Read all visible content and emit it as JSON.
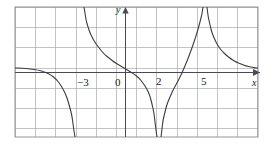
{
  "figure": {
    "kind": "cartesian-graph",
    "width": 275,
    "height": 145,
    "background": "#ffffff",
    "grid": {
      "color": "#a9a9ad",
      "border_color": "#8a8a90",
      "cell_px": 20.2,
      "left_px": 15,
      "top_px": 7,
      "right_px": 258,
      "bottom_px": 137,
      "visible": true
    },
    "axes": {
      "x_axis_y_px": 72,
      "y_axis_x_px": 125,
      "color": "#4a4a50",
      "x_label": "x",
      "y_label": "y",
      "x_arrow": "right",
      "y_arrow": "up"
    },
    "tick_labels": [
      {
        "text": "−3",
        "x_px": 77,
        "y_px": 77,
        "value": -3
      },
      {
        "text": "0",
        "x_px": 115,
        "y_px": 77,
        "value": 0
      },
      {
        "text": "2",
        "x_px": 156,
        "y_px": 76,
        "value": 2
      },
      {
        "text": "5",
        "x_px": 201,
        "y_px": 76,
        "value": 5
      }
    ]
  },
  "chart_data": {
    "type": "line",
    "title": "",
    "xlabel": "x",
    "ylabel": "y",
    "grid": true,
    "legend": null,
    "xlim": [
      -5.5,
      6.6
    ],
    "ylim": [
      -3.2,
      3.2
    ],
    "x_ticks": [
      -3,
      0,
      2,
      5
    ],
    "y_ticks": [],
    "vertical_asymptotes": [
      -2.3,
      1.55,
      3.9
    ],
    "horizontal_asymptote": 0,
    "series": [
      {
        "name": "branch-far-left",
        "comment": "upper-left branch, comes from left near y=0 then falls to -infinity at leftmost asymptote",
        "points_px": [
          [
            15,
            68
          ],
          [
            22,
            68
          ],
          [
            30,
            69
          ],
          [
            38,
            70
          ],
          [
            45,
            72
          ],
          [
            51,
            75
          ],
          [
            56,
            79
          ],
          [
            60,
            84
          ],
          [
            63,
            89
          ],
          [
            66,
            95
          ],
          [
            68,
            101
          ],
          [
            70,
            108
          ],
          [
            72,
            116
          ],
          [
            73,
            124
          ],
          [
            74,
            131
          ],
          [
            75,
            137
          ]
        ]
      },
      {
        "name": "branch-left-right-side",
        "comment": "descends from +infinity at leftmost asymptote, crosses x-axis near x=0, falls to -infinity at middle asymptote",
        "points_px": [
          [
            84,
            7
          ],
          [
            85,
            13
          ],
          [
            86,
            20
          ],
          [
            88,
            27
          ],
          [
            90,
            33
          ],
          [
            93,
            39
          ],
          [
            96,
            44
          ],
          [
            100,
            49
          ],
          [
            104,
            54
          ],
          [
            109,
            58
          ],
          [
            114,
            62
          ],
          [
            119,
            65
          ],
          [
            124,
            68
          ],
          [
            129,
            71
          ],
          [
            134,
            74
          ],
          [
            139,
            78
          ],
          [
            143,
            83
          ],
          [
            147,
            89
          ],
          [
            150,
            96
          ],
          [
            152,
            104
          ],
          [
            154,
            113
          ],
          [
            155,
            122
          ],
          [
            156,
            130
          ],
          [
            157,
            137
          ]
        ]
      },
      {
        "name": "branch-middle-right-side",
        "comment": "rises from -infinity at middle asymptote up to +infinity at right asymptote",
        "points_px": [
          [
            161,
            137
          ],
          [
            162,
            129
          ],
          [
            163,
            120
          ],
          [
            165,
            112
          ],
          [
            167,
            104
          ],
          [
            170,
            97
          ],
          [
            173,
            90
          ],
          [
            177,
            83
          ],
          [
            181,
            75
          ],
          [
            185,
            66
          ],
          [
            189,
            56
          ],
          [
            193,
            45
          ],
          [
            197,
            33
          ],
          [
            200,
            22
          ],
          [
            202,
            14
          ],
          [
            203,
            7
          ]
        ]
      },
      {
        "name": "branch-far-right",
        "comment": "descends from +infinity at right asymptote toward the x-axis on the right",
        "points_px": [
          [
            207,
            7
          ],
          [
            208,
            16
          ],
          [
            210,
            25
          ],
          [
            212,
            33
          ],
          [
            215,
            40
          ],
          [
            218,
            46
          ],
          [
            222,
            51
          ],
          [
            226,
            55
          ],
          [
            231,
            59
          ],
          [
            236,
            62
          ],
          [
            241,
            64
          ],
          [
            246,
            66
          ],
          [
            251,
            67
          ],
          [
            256,
            68
          ],
          [
            258,
            68
          ]
        ]
      }
    ],
    "curve_color": "#3c3c42",
    "curve_width_px": 1.1
  }
}
